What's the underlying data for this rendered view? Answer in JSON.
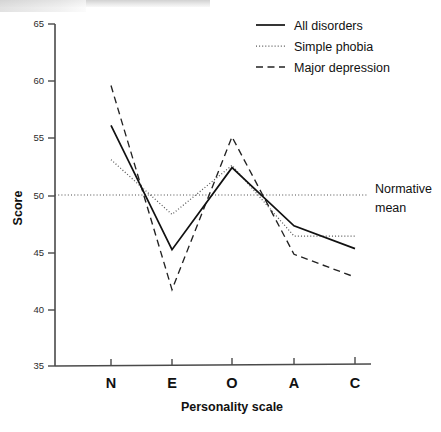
{
  "chart_data": {
    "type": "line",
    "title": "",
    "xlabel": "Personality scale",
    "ylabel": "Score",
    "categories": [
      "N",
      "E",
      "O",
      "A",
      "C"
    ],
    "ylim": [
      35,
      65
    ],
    "yticks": [
      35,
      40,
      45,
      50,
      55,
      60,
      65
    ],
    "grid": false,
    "legend_position": "top-right",
    "series": [
      {
        "name": "All disorders",
        "style": "solid",
        "values": [
          56.1,
          45.2,
          52.4,
          47.3,
          45.3
        ]
      },
      {
        "name": "Simple phobia",
        "style": "dotted",
        "values": [
          53.1,
          48.3,
          52.6,
          46.4,
          46.4
        ]
      },
      {
        "name": "Major depression",
        "style": "dashed",
        "values": [
          59.6,
          41.7,
          55.1,
          44.8,
          42.8
        ]
      }
    ],
    "annotations": [
      {
        "name": "normative-mean",
        "text_line1": "Normative",
        "text_line2": "mean",
        "value": 50,
        "style": "dotted-horizontal"
      }
    ]
  },
  "axes": {
    "y_label": "Score",
    "x_label": "Personality scale",
    "y_tick_labels": [
      "65",
      "60",
      "55",
      "50",
      "45",
      "40",
      "35"
    ],
    "x_tick_labels": [
      "N",
      "E",
      "O",
      "A",
      "C"
    ]
  },
  "legend": {
    "entries": [
      {
        "label": "All disorders",
        "swatch": "solid-line-swatch"
      },
      {
        "label": "Simple phobia",
        "swatch": "dotted-line-swatch"
      },
      {
        "label": "Major depression",
        "swatch": "dashed-line-swatch"
      }
    ]
  },
  "annotation": {
    "normative_mean_line1": "Normative",
    "normative_mean_line2": "mean"
  },
  "colors": {
    "ink": "#111111",
    "axis": "#4a4a4a",
    "dotted_series": "#555555",
    "background": "#ffffff"
  }
}
